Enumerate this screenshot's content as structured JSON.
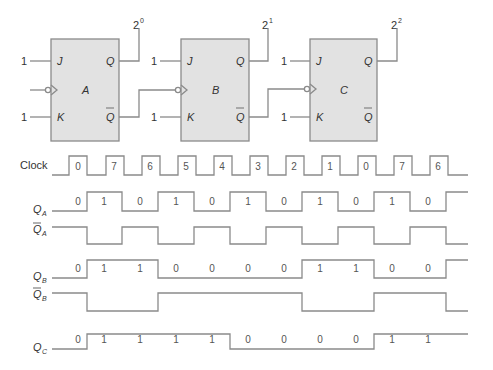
{
  "flip_flops": [
    {
      "name": "A",
      "j_input": "1",
      "k_input": "1",
      "output_label": "2",
      "output_exp": "0",
      "pin_j": "J",
      "pin_k": "K",
      "pin_q": "Q",
      "pin_qbar": "Q"
    },
    {
      "name": "B",
      "j_input": "1",
      "k_input": "1",
      "output_label": "2",
      "output_exp": "1",
      "pin_j": "J",
      "pin_k": "K",
      "pin_q": "Q",
      "pin_qbar": "Q"
    },
    {
      "name": "C",
      "j_input": "1",
      "k_input": "1",
      "output_label": "2",
      "output_exp": "2",
      "pin_j": "J",
      "pin_k": "K",
      "pin_q": "Q",
      "pin_qbar": "Q"
    }
  ],
  "timing": {
    "clock_label": "Clock",
    "clock_counts": [
      "0",
      "7",
      "6",
      "5",
      "4",
      "3",
      "2",
      "1",
      "0",
      "7",
      "6"
    ],
    "signals": [
      {
        "name": "Q",
        "sub": "A",
        "bar": false,
        "values": [
          "0",
          "1",
          "0",
          "1",
          "0",
          "1",
          "0",
          "1",
          "0",
          "1",
          "0"
        ]
      },
      {
        "name": "Q",
        "sub": "A",
        "bar": true,
        "values": []
      },
      {
        "name": "Q",
        "sub": "B",
        "bar": false,
        "values": [
          "0",
          "1",
          "1",
          "0",
          "0",
          "0",
          "0",
          "1",
          "1",
          "0",
          "0"
        ]
      },
      {
        "name": "Q",
        "sub": "B",
        "bar": true,
        "values": []
      },
      {
        "name": "Q",
        "sub": "C",
        "bar": false,
        "values": [
          "0",
          "1",
          "1",
          "1",
          "1",
          "0",
          "0",
          "0",
          "0",
          "1",
          "1"
        ]
      }
    ]
  },
  "colors": {
    "line": "#8a8a8a",
    "box_fill": "#e2e2e2",
    "text": "#333333"
  }
}
